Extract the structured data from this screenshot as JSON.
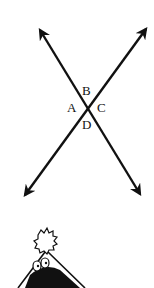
{
  "diagram": {
    "lines": [
      {
        "name": "line-1",
        "from": [
          38,
          27
        ],
        "to": [
          142,
          197
        ]
      },
      {
        "name": "line-2",
        "from": [
          148,
          26
        ],
        "to": [
          23,
          198
        ]
      }
    ],
    "intersection": [
      88,
      108
    ],
    "angle_labels": {
      "top": "B",
      "left": "A",
      "right": "C",
      "bottom": "D"
    },
    "colors": {
      "stroke": "#111111",
      "background": "#ffffff"
    }
  },
  "cartoon": {
    "description": "party hat character with pompom and eyes, partially cropped"
  }
}
